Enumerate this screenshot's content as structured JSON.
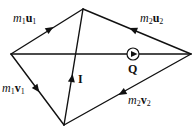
{
  "diagram": {
    "type": "momentum-vector-diagram",
    "colors": {
      "stroke": "#111111",
      "background": "#ffffff"
    },
    "vertices": {
      "left": [
        11,
        54
      ],
      "top": [
        83,
        9
      ],
      "right": [
        191,
        54
      ],
      "bottom": [
        64,
        125
      ]
    },
    "labels": {
      "m1u1": {
        "m": "m",
        "sub": "1",
        "v": "u",
        "vsub": "1"
      },
      "m2u2": {
        "m": "m",
        "sub": "2",
        "v": "u",
        "vsub": "2"
      },
      "m1v1": {
        "m": "m",
        "sub": "1",
        "v": "v",
        "vsub": "1"
      },
      "m2v2": {
        "m": "m",
        "sub": "2",
        "v": "v",
        "vsub": "2"
      },
      "impulse": "I",
      "q": "Q"
    }
  }
}
